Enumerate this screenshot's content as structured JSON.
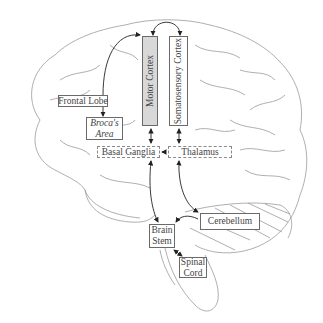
{
  "diagram": {
    "type": "brain-region-connectivity",
    "colors": {
      "outline": "#9a9a9a",
      "box_border": "#6a6a6a",
      "motor_fill": "#d8d8d8",
      "text": "#444444",
      "arrow": "#222222"
    },
    "regions": {
      "frontal_lobe": "Frontal Lobe",
      "brocas_area_line1": "Broca's",
      "brocas_area_line2": "Area",
      "motor_cortex": "Motor Cortex",
      "somatosensory_cortex": "Somatosensory Cortex",
      "basal_ganglia": "Basal Ganglia",
      "thalamus": "Thalamus",
      "cerebellum": "Cerebellum",
      "brain_stem_line1": "Brain",
      "brain_stem_line2": "Stem",
      "spinal_cord_line1": "Spinal",
      "spinal_cord_line2": "Cord"
    },
    "connections": [
      {
        "from": "Frontal Lobe",
        "to": "Motor Cortex",
        "type": "curved-arrow"
      },
      {
        "from": "Frontal Lobe",
        "to": "Broca's Area",
        "type": "arrow"
      },
      {
        "from": "Motor Cortex",
        "to": "Somatosensory Cortex",
        "type": "curved-bidirectional"
      },
      {
        "from": "Motor Cortex",
        "to": "Basal Ganglia",
        "type": "bidirectional"
      },
      {
        "from": "Somatosensory Cortex",
        "to": "Thalamus",
        "type": "bidirectional"
      },
      {
        "from": "Thalamus",
        "to": "Basal Ganglia",
        "type": "arrow"
      },
      {
        "from": "Basal Ganglia",
        "to": "Brain Stem",
        "type": "bidirectional"
      },
      {
        "from": "Thalamus",
        "to": "Cerebellum",
        "type": "bidirectional"
      },
      {
        "from": "Cerebellum",
        "to": "Brain Stem",
        "type": "arrow"
      },
      {
        "from": "Brain Stem",
        "to": "Spinal Cord",
        "type": "bidirectional"
      }
    ]
  }
}
